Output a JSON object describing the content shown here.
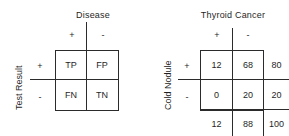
{
  "figure": {
    "type": "two-by-two-contingency-tables",
    "background_color": "#ffffff",
    "line_color": "#2b2b2b",
    "text_color": "#1f1f1f"
  },
  "tables": [
    {
      "id": "generic-confusion-matrix",
      "column_title": "Disease",
      "row_title": "Test Result",
      "column_headers": [
        "+",
        "-"
      ],
      "row_headers": [
        "+",
        "-"
      ],
      "cells": [
        [
          "TP",
          "FP"
        ],
        [
          "FN",
          "TN"
        ]
      ],
      "has_totals": false
    },
    {
      "id": "thyroid-cancer-cold-nodule",
      "column_title": "Thyroid Cancer",
      "row_title": "Cold Nodule",
      "column_headers": [
        "+",
        "-"
      ],
      "row_headers": [
        "+",
        "-"
      ],
      "cells": [
        [
          "12",
          "68"
        ],
        [
          "0",
          "20"
        ]
      ],
      "row_totals": [
        "80",
        "20"
      ],
      "column_totals": [
        "12",
        "88"
      ],
      "grand_total": "100",
      "has_totals": true
    }
  ],
  "left_table": {
    "column_title": "Disease",
    "row_title": "Test Result",
    "col_plus": "+",
    "col_minus": "-",
    "row_plus": "+",
    "row_minus": "-",
    "tp": "TP",
    "fp": "FP",
    "fn": "FN",
    "tn": "TN"
  },
  "right_table": {
    "column_title": "Thyroid Cancer",
    "row_title": "Cold Nodule",
    "col_plus": "+",
    "col_minus": "-",
    "row_plus": "+",
    "row_minus": "-",
    "a": "12",
    "b": "68",
    "c": "0",
    "d": "20",
    "row_total_top": "80",
    "row_total_bottom": "20",
    "col_total_left": "12",
    "col_total_right": "88",
    "grand_total": "100"
  }
}
